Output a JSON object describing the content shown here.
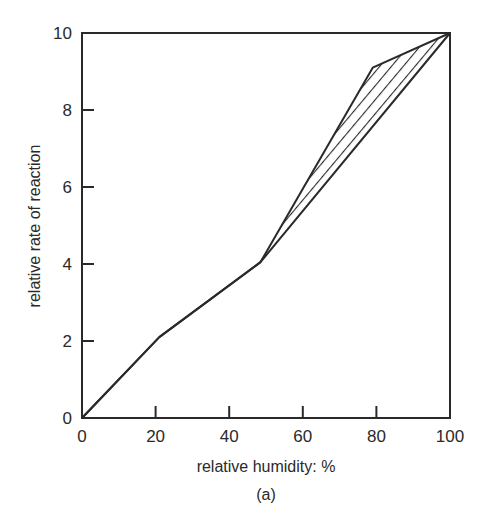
{
  "chart_data": {
    "type": "line",
    "title": "",
    "caption": "(a)",
    "xlabel": "relative humidity: %",
    "ylabel": "relative rate of reaction",
    "xlim": [
      0,
      100
    ],
    "ylim": [
      0,
      10
    ],
    "xticks": [
      0,
      20,
      40,
      60,
      80,
      100
    ],
    "yticks": [
      0,
      2,
      4,
      6,
      8,
      10
    ],
    "grid": false,
    "legend": null,
    "series": [
      {
        "name": "upper curve",
        "x": [
          0,
          21,
          48.5,
          79,
          100
        ],
        "y": [
          0,
          2.1,
          4.05,
          9.1,
          10
        ]
      },
      {
        "name": "lower curve",
        "x": [
          0,
          21,
          48.5,
          100
        ],
        "y": [
          0,
          2.1,
          4.05,
          10
        ]
      }
    ],
    "annotations": [
      {
        "type": "hatched-region",
        "description": "area between upper and lower curves from x=48.5 to x=100"
      }
    ]
  },
  "labels": {
    "xlabel": "relative humidity: %",
    "ylabel": "relative rate of reaction",
    "caption": "(a)"
  },
  "colors": {
    "ink": "#2a2a2a",
    "background": "#ffffff"
  }
}
